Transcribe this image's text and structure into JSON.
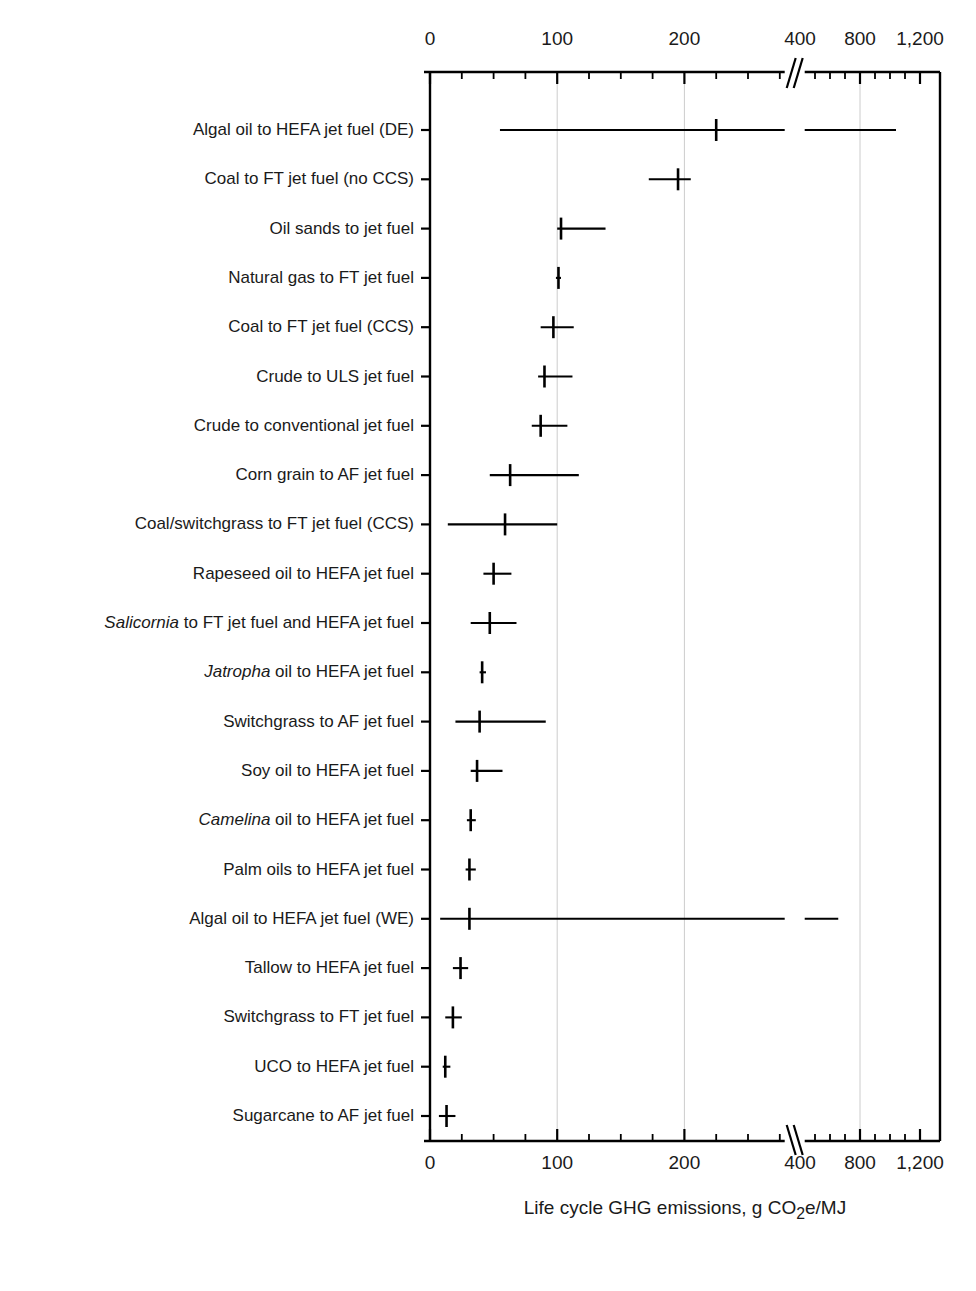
{
  "chart_data": {
    "type": "scatter",
    "title": "",
    "xlabel": "Life cycle GHG emissions, g CO2e/MJ",
    "xlabel_parts": {
      "pre": "Life cycle GHG emissions, g CO",
      "sub": "2",
      "post": "e/MJ"
    },
    "ylabel": "",
    "grid": true,
    "legend": "none",
    "orientation": "horizontal",
    "axis_break": {
      "present": true,
      "before": 282,
      "after": 380,
      "note": "axis compresses after break; 400, 800, 1,200 shown"
    },
    "xticks_major": [
      0,
      100,
      200,
      400,
      800,
      1200
    ],
    "xtick_labels": [
      "0",
      "100",
      "200",
      "400",
      "800",
      "1,200"
    ],
    "xticks_minor_segment1": [
      25,
      50,
      75,
      125,
      150,
      175,
      225,
      250,
      275
    ],
    "xticks_minor_segment2": [
      500,
      600,
      700,
      900,
      1000,
      1100
    ],
    "xlim": [
      0,
      1200
    ],
    "categories": [
      "Algal oil to HEFA jet fuel (DE)",
      "Coal to FT jet fuel (no CCS)",
      "Oil sands to jet fuel",
      "Natural gas to FT jet fuel",
      "Coal to FT jet fuel (CCS)",
      "Crude to ULS jet fuel",
      "Crude to conventional jet fuel",
      "Corn grain to AF jet fuel",
      "Coal/switchgrass to FT jet fuel (CCS)",
      "Rapeseed oil to HEFA jet fuel",
      "Salicornia to FT jet fuel and HEFA jet fuel",
      "Jatropha oil to HEFA jet fuel",
      "Switchgrass to AF jet fuel",
      "Soy oil to HEFA jet fuel",
      "Camelina oil to HEFA jet fuel",
      "Palm oils to HEFA jet fuel",
      "Algal oil to HEFA jet fuel (WE)",
      "Tallow to HEFA jet fuel",
      "Switchgrass to FT jet fuel",
      "UCO to HEFA jet fuel",
      "Sugarcane to AF jet fuel"
    ],
    "rows": [
      {
        "label": "Algal oil to HEFA jet fuel (DE)",
        "italic_prefix": "",
        "value": 225,
        "low": 55,
        "high": 1040
      },
      {
        "label": "Coal to FT jet fuel (no CCS)",
        "italic_prefix": "",
        "value": 195,
        "low": 172,
        "high": 205
      },
      {
        "label": "Oil sands to jet fuel",
        "italic_prefix": "",
        "value": 103,
        "low": 100,
        "high": 138
      },
      {
        "label": "Natural gas to FT jet fuel",
        "italic_prefix": "",
        "value": 101,
        "low": 99,
        "high": 103
      },
      {
        "label": "Coal to FT jet fuel (CCS)",
        "italic_prefix": "",
        "value": 97,
        "low": 87,
        "high": 113
      },
      {
        "label": "Crude to ULS jet fuel",
        "italic_prefix": "",
        "value": 90,
        "low": 85,
        "high": 112
      },
      {
        "label": "Crude to conventional jet fuel",
        "italic_prefix": "",
        "value": 87,
        "low": 80,
        "high": 108
      },
      {
        "label": "Corn grain to AF jet fuel",
        "italic_prefix": "",
        "value": 63,
        "low": 47,
        "high": 117
      },
      {
        "label": "Coal/switchgrass to FT jet fuel (CCS)",
        "italic_prefix": "",
        "value": 59,
        "low": 14,
        "high": 100
      },
      {
        "label": "Rapeseed oil to HEFA jet fuel",
        "italic_prefix": "",
        "value": 50,
        "low": 42,
        "high": 64
      },
      {
        "label": "Salicornia to FT jet fuel and HEFA jet fuel",
        "italic_prefix": "Salicornia",
        "value": 47,
        "low": 32,
        "high": 68
      },
      {
        "label": "Jatropha oil to HEFA jet fuel",
        "italic_prefix": "Jatropha",
        "value": 41,
        "low": 39,
        "high": 44
      },
      {
        "label": "Switchgrass to AF jet fuel",
        "italic_prefix": "",
        "value": 39,
        "low": 20,
        "high": 91
      },
      {
        "label": "Soy oil to HEFA jet fuel",
        "italic_prefix": "",
        "value": 37,
        "low": 32,
        "high": 57
      },
      {
        "label": "Camelina oil to HEFA jet fuel",
        "italic_prefix": "Camelina",
        "value": 32,
        "low": 29,
        "high": 36
      },
      {
        "label": "Palm oils to HEFA jet fuel",
        "italic_prefix": "",
        "value": 31,
        "low": 28,
        "high": 36
      },
      {
        "label": "Algal oil to HEFA jet fuel (WE)",
        "italic_prefix": "",
        "value": 31,
        "low": 8,
        "high": 655
      },
      {
        "label": "Tallow to HEFA jet fuel",
        "italic_prefix": "",
        "value": 24,
        "low": 18,
        "high": 30
      },
      {
        "label": "Switchgrass to FT jet fuel",
        "italic_prefix": "",
        "value": 18,
        "low": 12,
        "high": 25
      },
      {
        "label": "UCO to HEFA jet fuel",
        "italic_prefix": "",
        "value": 12,
        "low": 10,
        "high": 16
      },
      {
        "label": "Sugarcane to AF jet fuel",
        "italic_prefix": "",
        "value": 13,
        "low": 7,
        "high": 20
      }
    ]
  },
  "colors": {
    "axis": "#000000",
    "marker": "#000000",
    "grid": "#cccccc",
    "text": "#1a1a1a",
    "background": "#ffffff"
  }
}
